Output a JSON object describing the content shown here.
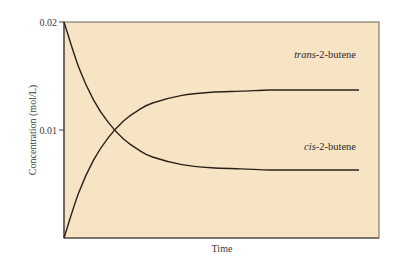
{
  "chart_data": {
    "type": "line",
    "title": "",
    "xlabel": "Time",
    "ylabel": "Concentration (mol/L)",
    "ylim": [
      0,
      0.02
    ],
    "yticks": [
      {
        "value": 0.02,
        "label": "0.02"
      },
      {
        "value": 0.01,
        "label": "0.01"
      }
    ],
    "xticks": [],
    "grid": false,
    "legend": "inline labels at right end of curves",
    "background_color": "#f7e4c4",
    "line_color": "#2b2118",
    "x": [
      0,
      0.05,
      0.1,
      0.15,
      0.2,
      0.25,
      0.3,
      0.4,
      0.5,
      0.6,
      0.7,
      0.8,
      0.9,
      1.0
    ],
    "series": [
      {
        "name": "trans-2-butene",
        "label_italic": "trans",
        "label_rest": "-2-butene",
        "values": [
          0.0,
          0.0042,
          0.0072,
          0.0093,
          0.0108,
          0.0118,
          0.0125,
          0.0132,
          0.0135,
          0.0136,
          0.0137,
          0.0137,
          0.0137,
          0.0137
        ]
      },
      {
        "name": "cis-2-butene",
        "label_italic": "cis",
        "label_rest": "-2-butene",
        "values": [
          0.02,
          0.0158,
          0.0128,
          0.0107,
          0.0092,
          0.0082,
          0.0075,
          0.0068,
          0.0065,
          0.0064,
          0.0063,
          0.0063,
          0.0063,
          0.0063
        ]
      }
    ]
  }
}
